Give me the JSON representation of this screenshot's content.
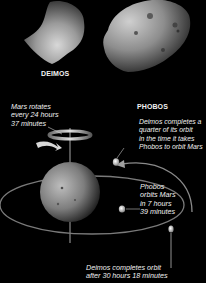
{
  "moons": {
    "deimos": {
      "label": "DEIMOS"
    },
    "phobos": {
      "label": "PHOBOS"
    }
  },
  "captions": {
    "mars_rotation": "Mars rotates\nevery 24 hours\n37 minutes",
    "deimos_quarter": "Deimos completes a\nquarter of its orbit\nin the time it takes\nPhobos to orbit Mars",
    "phobos_orbit": "Phobos\norbits Mars\nin 7 hours\n39 minutes",
    "deimos_orbit": "Deimos completes orbit\nafter 30 hours 18 minutes"
  },
  "colors": {
    "background": "#000000",
    "text": "#f0f0f0",
    "orbit": "#8a8a8a"
  }
}
